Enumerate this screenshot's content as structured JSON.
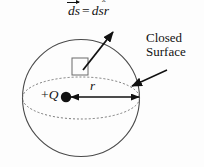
{
  "figure": {
    "background_color": "#fdfdfd",
    "stroke_color": "#111111",
    "labels": {
      "differential_area_vector": {
        "lhs_symbol": "ds",
        "equals": "=",
        "rhs_scalar": "ds",
        "rhs_unit_vector": "r",
        "hat": "̂",
        "full_text": "ds⃗ = ds r̂"
      },
      "closed_surface_line1": "Closed",
      "closed_surface_line2": "Surface",
      "charge_sign": "+",
      "charge_symbol": "Q",
      "radius_symbol": "r"
    },
    "geometry": {
      "sphere": {
        "cx": 81,
        "cy": 98,
        "r": 58.5,
        "stroke": "#4a4a4a",
        "stroke_width": 1.1
      },
      "equator_ellipse": {
        "cx": 81,
        "cy": 98,
        "rx": 58.5,
        "ry": 21,
        "dash": "2,2",
        "stroke": "#6b6b6b"
      },
      "charge_dot": {
        "cx": 66,
        "cy": 97,
        "r": 5.2,
        "fill": "#111111"
      },
      "radius_arrow": {
        "x1": 70,
        "y1": 97,
        "x2": 139,
        "y2": 97,
        "double_headed": true
      },
      "area_element_square": {
        "x": 72,
        "y": 58,
        "w": 16,
        "h": 17,
        "stroke": "#6a6a6a"
      },
      "normal_arrow": {
        "x1": 83,
        "y1": 70,
        "x2": 114,
        "y2": 31
      },
      "surface_pointer_arrow": {
        "x1": 167,
        "y1": 70,
        "x2": 131,
        "y2": 86
      }
    }
  }
}
